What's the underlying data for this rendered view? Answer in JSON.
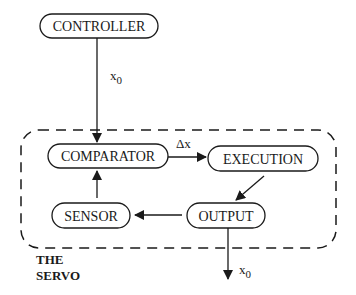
{
  "nodes": {
    "controller": "CONTROLLER",
    "comparator": "COMPARATOR",
    "execution": "EXECUTION",
    "output": "OUTPUT",
    "sensor": "SENSOR"
  },
  "edges": {
    "controller_to_comparator": {
      "label": "x",
      "sub": "0"
    },
    "comparator_to_execution": {
      "label": "Δx"
    },
    "output_out": {
      "label": "x",
      "sub": "0"
    }
  },
  "group": {
    "title_line1": "THE",
    "title_line2": "SERVO"
  },
  "colors": {
    "stroke": "#1a1a1a",
    "background": "#ffffff"
  }
}
